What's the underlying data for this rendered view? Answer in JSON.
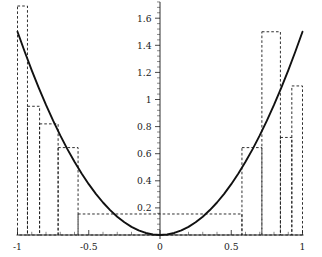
{
  "chart_data": {
    "type": "line",
    "title": "",
    "subtitle": "",
    "xlabel": "",
    "ylabel": "",
    "xlim": [
      -1.05,
      1.05
    ],
    "ylim": [
      0,
      1.72
    ],
    "grid": false,
    "legend": null,
    "x_ticks": [
      -1,
      -0.5,
      0,
      0.5,
      1
    ],
    "x_tick_labels": [
      "-1",
      "-0.5",
      "0",
      "0.5",
      "1"
    ],
    "x_minor_ticks": [
      -0.9,
      -0.8,
      -0.7,
      -0.6,
      -0.4,
      -0.3,
      -0.2,
      -0.1,
      0.1,
      0.2,
      0.3,
      0.4,
      0.6,
      0.7,
      0.8,
      0.9
    ],
    "y_ticks": [
      0.2,
      0.4,
      0.6,
      0.8,
      1,
      1.2,
      1.4,
      1.6
    ],
    "y_tick_labels": [
      "0.2",
      "0.4",
      "0.6",
      "0.8",
      "1",
      "1.2",
      "1.4",
      "1.6"
    ],
    "y_minor_count_between": 4,
    "series": [
      {
        "name": "curve",
        "style": "solid",
        "color": "#111111",
        "description": "smooth upward parabola through origin reaching 1.5 at x = -1 and x = 1",
        "x": [
          -1,
          -0.95,
          -0.9,
          -0.85,
          -0.8,
          -0.75,
          -0.7,
          -0.65,
          -0.6,
          -0.55,
          -0.5,
          -0.45,
          -0.4,
          -0.35,
          -0.3,
          -0.25,
          -0.2,
          -0.15,
          -0.1,
          -0.05,
          0,
          0.05,
          0.1,
          0.15,
          0.2,
          0.25,
          0.3,
          0.35,
          0.4,
          0.45,
          0.5,
          0.55,
          0.6,
          0.65,
          0.7,
          0.75,
          0.8,
          0.85,
          0.9,
          0.95,
          1
        ],
        "y": [
          1.5,
          1.354,
          1.215,
          1.084,
          0.96,
          0.844,
          0.735,
          0.634,
          0.54,
          0.454,
          0.375,
          0.304,
          0.24,
          0.184,
          0.135,
          0.094,
          0.06,
          0.034,
          0.015,
          0.004,
          0,
          0.004,
          0.015,
          0.034,
          0.06,
          0.094,
          0.135,
          0.184,
          0.24,
          0.304,
          0.375,
          0.454,
          0.54,
          0.634,
          0.735,
          0.844,
          0.96,
          1.084,
          1.215,
          1.354,
          1.5
        ]
      },
      {
        "name": "step-approximation",
        "style": "dashed",
        "color": "#1a1a1a",
        "description": "dashed rectangles forming a piecewise-constant approximation of the curve",
        "rectangles": [
          {
            "x0": -1.0,
            "x1": -0.93,
            "height": 1.69
          },
          {
            "x0": -0.93,
            "x1": -0.845,
            "height": 0.95
          },
          {
            "x0": -0.845,
            "x1": -0.715,
            "height": 0.82
          },
          {
            "x0": -0.715,
            "x1": -0.575,
            "height": 0.645
          },
          {
            "x0": -0.575,
            "x1": 0.575,
            "height": 0.155
          },
          {
            "x0": 0.575,
            "x1": 0.715,
            "height": 0.645
          },
          {
            "x0": 0.715,
            "x1": 0.845,
            "height": 1.5
          },
          {
            "x0": 0.845,
            "x1": 0.925,
            "height": 0.72
          },
          {
            "x0": 0.925,
            "x1": 1.0,
            "height": 1.1
          }
        ]
      }
    ]
  },
  "axes": {
    "x_axis_name": "horizontal-axis",
    "y_axis_name": "vertical-axis",
    "origin_label": "0"
  }
}
